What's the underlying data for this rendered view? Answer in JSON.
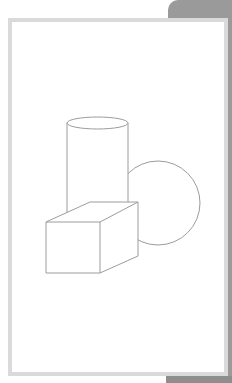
{
  "figure": {
    "stroke_color": "#9c9c9c",
    "frame_border_color": "#dadada",
    "shadow_color": "#9a9a9a",
    "shapes": [
      "cylinder",
      "sphere",
      "box"
    ]
  }
}
